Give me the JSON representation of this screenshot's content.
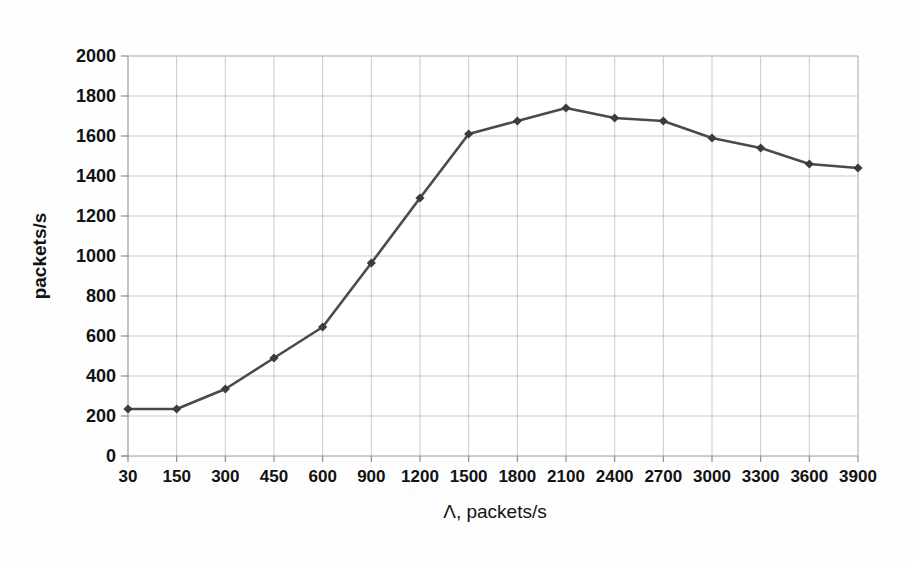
{
  "chart_data": {
    "type": "line",
    "title": "",
    "xlabel": "Λ, packets/s",
    "ylabel": "packets/s",
    "categories": [
      "30",
      "150",
      "300",
      "450",
      "600",
      "900",
      "1200",
      "1500",
      "1800",
      "2100",
      "2400",
      "2700",
      "3000",
      "3300",
      "3600",
      "3900"
    ],
    "values": [
      235,
      235,
      335,
      490,
      645,
      965,
      1290,
      1610,
      1675,
      1740,
      1690,
      1675,
      1590,
      1540,
      1460,
      1440
    ],
    "series": [
      {
        "name": "throughput",
        "values": [
          235,
          235,
          335,
          490,
          645,
          965,
          1290,
          1610,
          1675,
          1740,
          1690,
          1675,
          1590,
          1540,
          1460,
          1440
        ]
      }
    ],
    "ylim": [
      0,
      2000
    ],
    "yticks": [
      "0",
      "200",
      "400",
      "600",
      "800",
      "1000",
      "1200",
      "1400",
      "1600",
      "1800",
      "2000"
    ],
    "ytick_values": [
      0,
      200,
      400,
      600,
      800,
      1000,
      1200,
      1400,
      1600,
      1800,
      2000
    ],
    "grid": "both",
    "legend": "none",
    "marker": "diamond",
    "line_color": "#4a4a4a",
    "marker_color": "#3c3c3c",
    "grid_color": "#c9c9c9",
    "axis_color": "#8d8d8d",
    "background_color": "#ffffff"
  },
  "axes": {
    "y_axis_title": "packets/s",
    "x_axis_title": "Λ, packets/s"
  }
}
